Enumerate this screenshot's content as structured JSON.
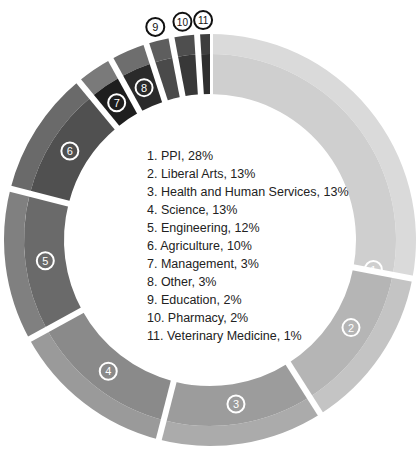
{
  "chart_data": {
    "type": "pie",
    "variant": "donut",
    "title": "",
    "categories": [
      "PPI",
      "Liberal Arts",
      "Health and Human Services",
      "Science",
      "Engineering",
      "Agriculture",
      "Management",
      "Other",
      "Education",
      "Pharmacy",
      "Veterinary Medicine"
    ],
    "values": [
      28,
      13,
      13,
      13,
      12,
      10,
      3,
      3,
      2,
      2,
      1
    ],
    "unit": "%",
    "labels": [
      "1",
      "2",
      "3",
      "4",
      "5",
      "6",
      "7",
      "8",
      "9",
      "10",
      "11"
    ],
    "colors": [
      "#cfcfcf",
      "#b5b5b5",
      "#9c9c9c",
      "#8a8a8a",
      "#6a6a6a",
      "#505050",
      "#1e1e1e",
      "#2a2a2a",
      "#4a4a4a",
      "#383838",
      "#2e2e2e"
    ],
    "outer_band_colors": [
      "#dadada",
      "#c4c4c4",
      "#ababab",
      "#9a9a9a",
      "#808080",
      "#6a6a6a",
      "#7a7a7a",
      "#6e6e6e",
      "#5e5e5e",
      "#4e4e4e",
      "#3e3e3e"
    ],
    "legend_position": "center"
  },
  "legend": [
    "1. PPI, 28%",
    "2. Liberal Arts, 13%",
    "3. Health and Human Services, 13%",
    "4. Science, 13%",
    "5. Engineering, 12%",
    "6. Agriculture, 10%",
    "7. Management, 3%",
    "8. Other, 3%",
    "9. Education, 2%",
    "10. Pharmacy, 2%",
    "11. Veterinary Medicine, 1%"
  ]
}
